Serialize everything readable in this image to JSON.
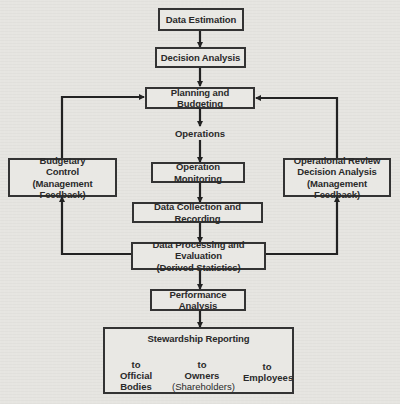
{
  "diagram": {
    "nodes": {
      "data_estimation": "Data Estimation",
      "decision_analysis": "Decision Analysis",
      "planning_budgeting": "Planning and Budgeting",
      "operations": "Operations",
      "operation_monitoring": "Operation Monitoring",
      "data_collection": "Data Collection and Recording",
      "data_processing_line1": "Data Processing and Evaluation",
      "data_processing_line2": "(Derived Statistics)",
      "performance_analysis": "Performance Analysis",
      "budgetary_control_line1": "Budgetary",
      "budgetary_control_line2": "Control",
      "budgetary_control_line3": "(Management Feedback)",
      "operational_review_line1": "Operational Review",
      "operational_review_line2": "Decision Analysis",
      "operational_review_line3": "(Management Feedback)",
      "stewardship_reporting": "Stewardship Reporting"
    },
    "reporting_targets": [
      {
        "prefix": "to",
        "line1": "Official Bodies",
        "line2": ""
      },
      {
        "prefix": "to",
        "line1": "Owners",
        "line2": "(Shareholders)"
      },
      {
        "prefix": "to",
        "line1": "Employees",
        "line2": ""
      }
    ],
    "edges": [
      [
        "Data Estimation",
        "Decision Analysis"
      ],
      [
        "Decision Analysis",
        "Planning and Budgeting"
      ],
      [
        "Planning and Budgeting",
        "Operations"
      ],
      [
        "Operations",
        "Operation Monitoring"
      ],
      [
        "Operation Monitoring",
        "Data Collection and Recording"
      ],
      [
        "Data Collection and Recording",
        "Data Processing and Evaluation"
      ],
      [
        "Data Processing and Evaluation",
        "Budgetary Control"
      ],
      [
        "Data Processing and Evaluation",
        "Operational Review Decision Analysis"
      ],
      [
        "Budgetary Control",
        "Planning and Budgeting"
      ],
      [
        "Operational Review Decision Analysis",
        "Planning and Budgeting"
      ],
      [
        "Data Processing and Evaluation",
        "Performance Analysis"
      ],
      [
        "Performance Analysis",
        "Stewardship Reporting"
      ],
      [
        "Stewardship Reporting",
        "Official Bodies"
      ],
      [
        "Stewardship Reporting",
        "Owners (Shareholders)"
      ],
      [
        "Stewardship Reporting",
        "Employees"
      ]
    ]
  }
}
